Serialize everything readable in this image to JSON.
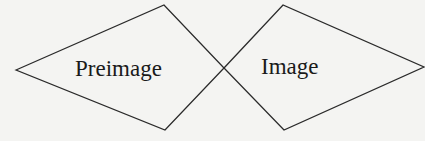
{
  "diagram": {
    "stroke_color": "#2a2a2a",
    "background_color": "#f4f4f2",
    "shapes": [
      {
        "id": "preimage",
        "label": "Preimage",
        "points": [
          [
            16,
            70
          ],
          [
            164,
            5
          ],
          [
            224,
            68
          ],
          [
            165,
            130
          ]
        ]
      },
      {
        "id": "image",
        "label": "Image",
        "points": [
          [
            224,
            68
          ],
          [
            283,
            5
          ],
          [
            424,
            67
          ],
          [
            284,
            130
          ]
        ]
      }
    ],
    "crossing_point": [
      224,
      68
    ]
  }
}
